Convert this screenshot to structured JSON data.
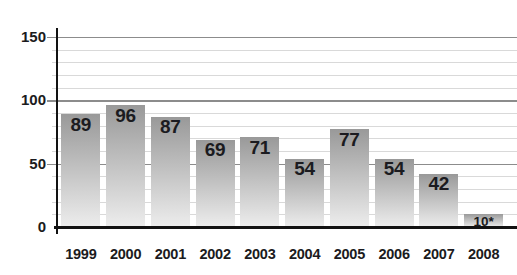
{
  "chart_data": {
    "type": "bar",
    "title": "",
    "xlabel": "",
    "ylabel": "",
    "categories": [
      "1999",
      "2000",
      "2001",
      "2002",
      "2003",
      "2004",
      "2005",
      "2006",
      "2007",
      "2008"
    ],
    "values": [
      89,
      96,
      87,
      69,
      71,
      54,
      77,
      54,
      42,
      10
    ],
    "bar_labels": [
      "89",
      "96",
      "87",
      "69",
      "71",
      "54",
      "77",
      "54",
      "42",
      "10*"
    ],
    "y_ticks": [
      0,
      50,
      100,
      150
    ],
    "ylim": [
      0,
      150
    ],
    "grid_minor_step": 10,
    "grid": "on",
    "legend": "none"
  },
  "colors": {
    "background": "#ffffff",
    "bar_gradient_top": "#999999",
    "bar_gradient_bottom": "#ededed",
    "value_label_text": "#1b1b20",
    "tick_label_text": "#1b1b20",
    "axis_line": "#121212",
    "grid_major": "#8c8c8c",
    "grid_minor": "#d9d9d9"
  }
}
